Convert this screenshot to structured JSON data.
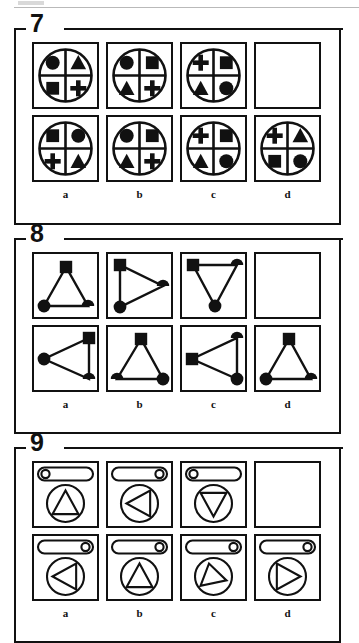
{
  "document": {
    "type": "non-verbal-reasoning-test-page",
    "page_artifact_top": true
  },
  "puzzles": [
    {
      "number": "7",
      "name": "puzzle-7",
      "style": "quartered-circle",
      "column_labels": [
        "a",
        "b",
        "c",
        "d"
      ],
      "rows": [
        {
          "name": "problem-row",
          "cells": [
            {
              "label": "a",
              "empty": false,
              "quadrants": {
                "tl": "circle",
                "tr": "triangle",
                "bl": "square",
                "br": "plus"
              }
            },
            {
              "label": "b",
              "empty": false,
              "quadrants": {
                "tl": "circle",
                "tr": "square",
                "bl": "triangle",
                "br": "plus"
              }
            },
            {
              "label": "c",
              "empty": false,
              "quadrants": {
                "tl": "plus",
                "tr": "square",
                "bl": "triangle",
                "br": "circle"
              }
            },
            {
              "label": "d",
              "empty": true,
              "quadrants": null
            }
          ]
        },
        {
          "name": "answer-row",
          "cells": [
            {
              "label": "a",
              "empty": false,
              "quadrants": {
                "tl": "square",
                "tr": "circle",
                "bl": "plus",
                "br": "triangle"
              }
            },
            {
              "label": "b",
              "empty": false,
              "quadrants": {
                "tl": "circle",
                "tr": "square",
                "bl": "triangle",
                "br": "plus"
              }
            },
            {
              "label": "c",
              "empty": false,
              "quadrants": {
                "tl": "plus",
                "tr": "square",
                "bl": "triangle",
                "br": "circle"
              }
            },
            {
              "label": "d",
              "empty": false,
              "quadrants": {
                "tl": "plus",
                "tr": "triangle",
                "bl": "square",
                "br": "circle"
              }
            }
          ]
        }
      ]
    },
    {
      "number": "8",
      "name": "puzzle-8",
      "style": "triangle-with-vertex-markers",
      "column_labels": [
        "a",
        "b",
        "c",
        "d"
      ],
      "rows": [
        {
          "name": "problem-row",
          "cells": [
            {
              "label": "a",
              "empty": false,
              "points": [
                [
                  32,
                  13
                ],
                [
                  10,
                  52
                ],
                [
                  54,
                  52
                ]
              ],
              "markers": [
                "square",
                "circle",
                "half-circle-right"
              ]
            },
            {
              "label": "b",
              "empty": false,
              "points": [
                [
                  12,
                  11
                ],
                [
                  12,
                  53
                ],
                [
                  55,
                  32
                ]
              ],
              "markers": [
                "square",
                "circle",
                "half-circle-right"
              ]
            },
            {
              "label": "c",
              "empty": false,
              "points": [
                [
                  11,
                  11
                ],
                [
                  55,
                  11
                ],
                [
                  33,
                  52
                ]
              ],
              "markers": [
                "square",
                "half-circle-right",
                "circle"
              ]
            },
            {
              "label": "d",
              "empty": true,
              "points": null,
              "markers": null
            }
          ]
        },
        {
          "name": "answer-row",
          "cells": [
            {
              "label": "a",
              "empty": false,
              "points": [
                [
                  55,
                  11
                ],
                [
                  10,
                  32
                ],
                [
                  55,
                  52
                ]
              ],
              "markers": [
                "square",
                "circle",
                "half-circle-right"
              ]
            },
            {
              "label": "b",
              "empty": false,
              "points": [
                [
                  33,
                  12
                ],
                [
                  9,
                  52
                ],
                [
                  55,
                  52
                ]
              ],
              "markers": [
                "square",
                "half-circle-right",
                "circle"
              ]
            },
            {
              "label": "c",
              "empty": false,
              "points": [
                [
                  10,
                  32
                ],
                [
                  55,
                  11
                ],
                [
                  55,
                  52
                ]
              ],
              "markers": [
                "square",
                "half-circle-right",
                "circle"
              ]
            },
            {
              "label": "d",
              "empty": false,
              "points": [
                [
                  33,
                  12
                ],
                [
                  10,
                  52
                ],
                [
                  55,
                  52
                ]
              ],
              "markers": [
                "square",
                "circle",
                "half-circle-right"
              ]
            }
          ]
        }
      ]
    },
    {
      "number": "9",
      "name": "puzzle-9",
      "style": "pill-and-circled-triangle",
      "column_labels": [
        "a",
        "b",
        "c",
        "d"
      ],
      "rows": [
        {
          "name": "problem-row",
          "cells": [
            {
              "label": "a",
              "empty": false,
              "pill_dot": "left",
              "triangle": "up"
            },
            {
              "label": "b",
              "empty": false,
              "pill_dot": "right",
              "triangle": "left"
            },
            {
              "label": "c",
              "empty": false,
              "pill_dot": "left",
              "triangle": "down"
            },
            {
              "label": "d",
              "empty": true,
              "pill_dot": null,
              "triangle": null
            }
          ]
        },
        {
          "name": "answer-row",
          "cells": [
            {
              "label": "a",
              "empty": false,
              "pill_dot": "right",
              "triangle": "left"
            },
            {
              "label": "b",
              "empty": false,
              "pill_dot": "right",
              "triangle": "up"
            },
            {
              "label": "c",
              "empty": false,
              "pill_dot": "right",
              "triangle": "up-tilted"
            },
            {
              "label": "d",
              "empty": false,
              "pill_dot": "right",
              "triangle": "right"
            }
          ]
        }
      ]
    }
  ],
  "colors": {
    "ink": "#111111",
    "paper": "#ffffff",
    "page_artifact": "#b9b9b9"
  }
}
